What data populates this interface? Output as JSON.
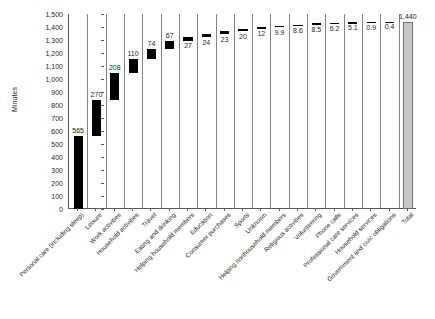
{
  "chart_data": {
    "type": "bar",
    "subtype": "waterfall",
    "title": "",
    "xlabel": "",
    "ylabel": "Minutes",
    "ylim": [
      0,
      1500
    ],
    "ytick_step": 100,
    "grid": "vertical-category-dividers",
    "legend": "none",
    "categories": [
      "Personal care (including sleep)",
      "Leisure",
      "Work activities",
      "Household activities",
      "Travel",
      "Eating and drinking",
      "Helping household members",
      "Education",
      "Consumer purchases",
      "Sports",
      "Unknown",
      "Helping nonhousehold members",
      "Religious activities",
      "Volunteering",
      "Phone calls",
      "Professional care services",
      "Household services",
      "Government and civic obligations",
      "Total"
    ],
    "values": [
      565,
      270,
      208,
      110,
      74,
      67,
      27,
      24,
      23,
      20,
      12,
      9.9,
      8.6,
      8.5,
      6.2,
      5.1,
      0.9,
      0.4,
      1440
    ],
    "value_labels": [
      "565",
      "270",
      "208",
      "110",
      "74",
      "67",
      "27",
      "24",
      "23",
      "20",
      "12",
      "9.9",
      "8.6",
      "8.5",
      "6.2",
      "5.1",
      "0.9",
      "0.4",
      "1,440"
    ],
    "bar_bases": [
      0,
      565,
      835,
      1043,
      1153,
      1227,
      1294,
      1321,
      1345,
      1368,
      1388,
      1400,
      1409.9,
      1418.5,
      1427,
      1433.2,
      1438.3,
      1439.2,
      0
    ],
    "bar_tops": [
      565,
      835,
      1043,
      1153,
      1227,
      1294,
      1321,
      1345,
      1368,
      1388,
      1400,
      1409.9,
      1418.5,
      1427,
      1433.2,
      1438.3,
      1439.2,
      1439.6,
      1440
    ],
    "label_placement": [
      "above",
      "above",
      "above",
      "above",
      "above",
      "above",
      "below",
      "below",
      "below",
      "below",
      "below",
      "below",
      "below",
      "below",
      "below",
      "below",
      "below",
      "below",
      "above"
    ],
    "ytick_labels": [
      "1,500",
      "1,400",
      "1,300",
      "1,200",
      "1,100",
      "1,000",
      "900",
      "800",
      "700",
      "600",
      "500",
      "400",
      "300",
      "200",
      "100",
      "0"
    ],
    "ytick_values": [
      1500,
      1400,
      1300,
      1200,
      1100,
      1000,
      900,
      800,
      700,
      600,
      500,
      400,
      300,
      200,
      100,
      0
    ],
    "colors": {
      "bar": "#000000",
      "total_bar": "#c9c9c9",
      "total_bar_border": "#6d6e71",
      "axis": "#58595b",
      "divider": "#808285",
      "text": "#231f20",
      "background": "#ffffff"
    }
  }
}
